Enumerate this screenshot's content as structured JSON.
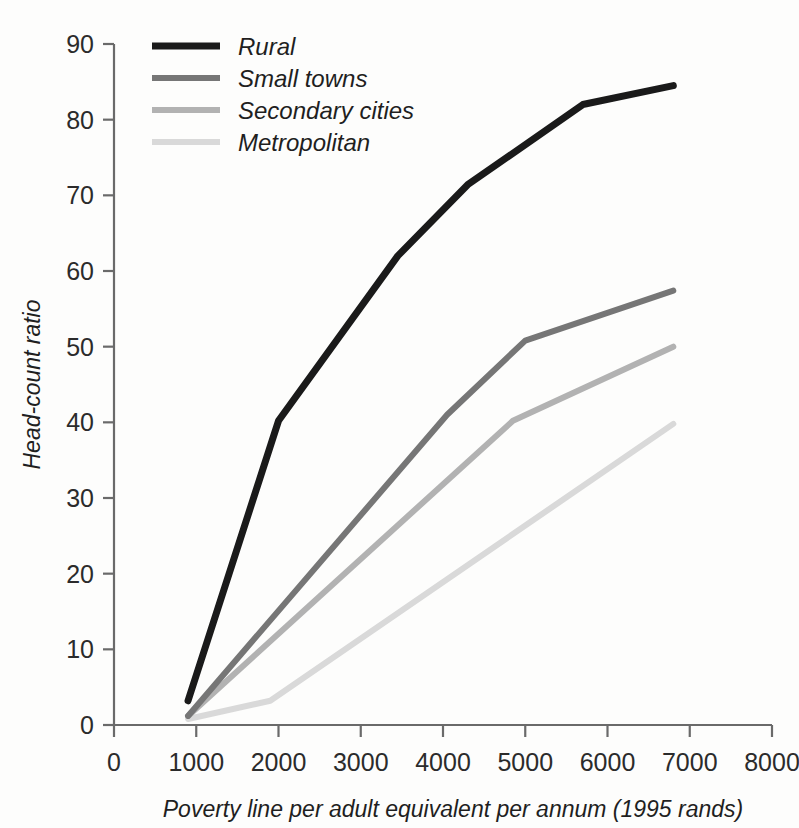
{
  "chart_data": {
    "type": "line",
    "title": "",
    "xlabel": "Poverty line per adult equivalent per annum (1995 rands)",
    "ylabel": "Head-count ratio",
    "xlim": [
      0,
      8000
    ],
    "ylim": [
      0,
      90
    ],
    "xticks": [
      "0",
      "1000",
      "2000",
      "3000",
      "4000",
      "5000",
      "6000",
      "7000",
      "8000"
    ],
    "xtick_values": [
      0,
      1000,
      2000,
      3000,
      4000,
      5000,
      6000,
      7000,
      8000
    ],
    "yticks": [
      "0",
      "10",
      "20",
      "30",
      "40",
      "50",
      "60",
      "70",
      "80",
      "90"
    ],
    "ytick_values": [
      0,
      10,
      20,
      30,
      40,
      50,
      60,
      70,
      80,
      90
    ],
    "grid": false,
    "legend_position": "top-left",
    "series": [
      {
        "name": "Rural",
        "color": "#1a1a1a",
        "width": 7,
        "x": [
          900,
          2000,
          3450,
          4300,
          5700,
          6800
        ],
        "y": [
          3.2,
          40.2,
          62.0,
          71.4,
          82.0,
          84.5
        ]
      },
      {
        "name": "Small towns",
        "color": "#767676",
        "width": 6,
        "x": [
          900,
          4050,
          5000,
          6800
        ],
        "y": [
          1.2,
          41.0,
          50.8,
          57.4
        ]
      },
      {
        "name": "Secondary cities",
        "color": "#b2b2b2",
        "width": 6,
        "x": [
          900,
          4850,
          6800
        ],
        "y": [
          1.2,
          40.2,
          50.0
        ]
      },
      {
        "name": "Metropolitan",
        "color": "#d9d9d9",
        "width": 6,
        "x": [
          900,
          1900,
          6800
        ],
        "y": [
          0.8,
          3.2,
          39.8
        ]
      }
    ]
  },
  "legend": {
    "entries": [
      {
        "label": "Rural"
      },
      {
        "label": "Small towns"
      },
      {
        "label": "Secondary cities"
      },
      {
        "label": "Metropolitan"
      }
    ]
  },
  "colors": {
    "rural": "#1a1a1a",
    "small_towns": "#767676",
    "secondary_cities": "#b2b2b2",
    "metropolitan": "#d9d9d9",
    "axis": "#6a6a6a",
    "text": "#1f1f1f",
    "background": "#fdfdfc"
  }
}
